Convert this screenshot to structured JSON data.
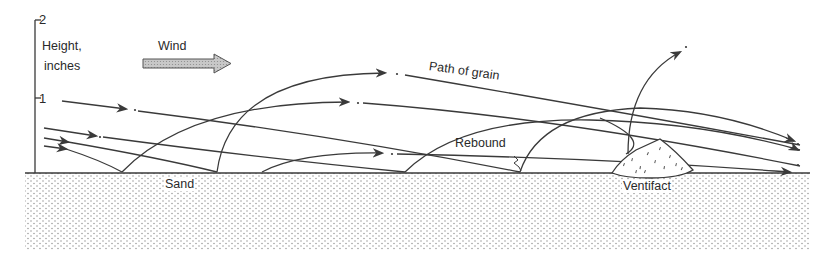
{
  "figure": {
    "axis": {
      "title_line1": "Height,",
      "title_line2": "inches",
      "ticks": [
        {
          "label": "2",
          "value": 2
        },
        {
          "label": "1",
          "value": 1
        }
      ]
    },
    "wind_label": "Wind",
    "path_label": "Path of grain",
    "rebound_label": "Rebound",
    "sand_label": "Sand",
    "ventifact_label": "Ventifact"
  },
  "colors": {
    "line": "#3a3a3a",
    "sand_dots": "#8a8a8a",
    "wind_arrow_fill": "#b5b5b5",
    "background": "#ffffff"
  }
}
